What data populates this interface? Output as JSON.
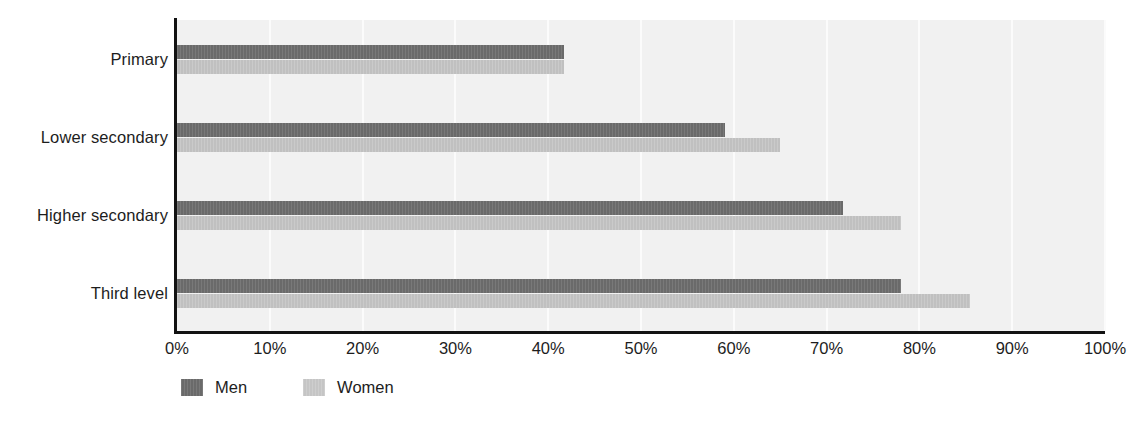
{
  "chart_data": {
    "type": "bar",
    "orientation": "horizontal",
    "title": "",
    "subtitle": "",
    "xlabel": "",
    "ylabel": "",
    "categories": [
      "Primary",
      "Lower secondary",
      "Higher secondary",
      "Third level"
    ],
    "series": [
      {
        "name": "Men",
        "color": "#6a6a6a",
        "values": [
          41.7,
          59.0,
          71.8,
          78.0
        ]
      },
      {
        "name": "Women",
        "color": "#c0c0c0",
        "values": [
          41.7,
          65.0,
          78.0,
          85.5
        ]
      }
    ],
    "xlim": [
      0,
      100
    ],
    "x_tick_values": [
      0,
      10,
      20,
      30,
      40,
      50,
      60,
      70,
      80,
      90,
      100
    ],
    "x_tick_labels": [
      "0%",
      "10%",
      "20%",
      "30%",
      "40%",
      "50%",
      "60%",
      "70%",
      "80%",
      "90%",
      "100%"
    ],
    "grid": "vertical",
    "gridline_color": "#fbfbfb",
    "plot_background": "#f1f1f1",
    "axis_color": "#121212",
    "legend_position": "bottom-left",
    "legend_entries": [
      "Men",
      "Women"
    ]
  },
  "legend": {
    "items": [
      {
        "label": "Men"
      },
      {
        "label": "Women"
      }
    ]
  }
}
